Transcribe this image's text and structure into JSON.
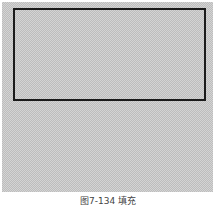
{
  "figure": {
    "caption": "图7-134 填充",
    "canvas_pattern": "checkerboard",
    "rectangle": {
      "border_color": "#1a1a1a",
      "fill": "checkerboard"
    },
    "colors": {
      "checker_light": "#d4d4d4",
      "checker_dark": "#bdbdbd",
      "border": "#1a1a1a"
    }
  }
}
